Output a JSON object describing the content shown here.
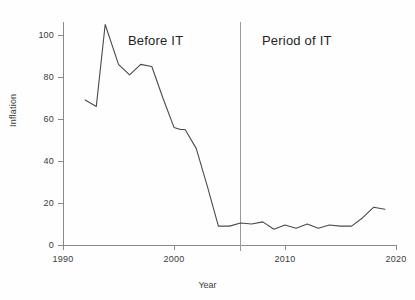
{
  "chart_data": {
    "type": "line",
    "title": "",
    "xlabel": "Year",
    "ylabel": "Inflation",
    "xlim": [
      1990,
      2020
    ],
    "ylim": [
      0,
      110
    ],
    "xticks": [
      1990,
      2000,
      2010,
      2020
    ],
    "xtick_labels": [
      "1990",
      "2000",
      "2010",
      "2020"
    ],
    "yticks": [
      0,
      20,
      40,
      60,
      80,
      100
    ],
    "ytick_labels": [
      "0",
      "20",
      "40",
      "60",
      "80",
      "100"
    ],
    "grid": false,
    "legend": null,
    "line_color": "#4a4a4a",
    "axis_color": "#8a8a8a",
    "series": [
      {
        "name": "Inflation",
        "x": [
          1992,
          1993,
          1993.8,
          1995,
          1996,
          1997,
          1998,
          1999,
          2000,
          2000.6,
          2001,
          2002,
          2003,
          2004,
          2005,
          2006,
          2007,
          2008,
          2009,
          2010,
          2011,
          2012,
          2013,
          2014,
          2015,
          2016,
          2017,
          2018,
          2019
        ],
        "values": [
          69,
          66,
          105,
          86,
          81,
          86,
          85,
          70,
          56,
          55,
          55,
          46,
          28,
          9,
          9,
          10.5,
          10,
          11,
          7.5,
          9.5,
          8,
          10,
          8,
          9.5,
          9,
          9,
          13,
          18,
          17
        ]
      }
    ],
    "annotations": [
      {
        "name": "before-it",
        "text": "Before IT",
        "x": 1997.5,
        "y": 97
      },
      {
        "name": "period-it",
        "text": "Period of IT",
        "x": 2011.5,
        "y": 97
      }
    ],
    "vertical_divider": {
      "x": 2006,
      "color": "#9a9a9a"
    }
  }
}
